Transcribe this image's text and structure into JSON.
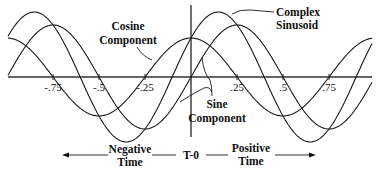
{
  "diagram": {
    "labels": {
      "cosine": [
        "Cosine",
        "Component"
      ],
      "sine": [
        "Sine",
        "Component"
      ],
      "complex": [
        "Complex",
        "Sinusoid"
      ],
      "negative_time": [
        "Negative",
        "Time"
      ],
      "positive_time": [
        "Positive",
        "Time"
      ],
      "origin": "T-0"
    },
    "ticks": [
      {
        "label": "-.75",
        "value": -0.75
      },
      {
        "label": "-.5",
        "value": -0.5
      },
      {
        "label": "-.25",
        "value": -0.25
      },
      {
        "label": ".25",
        "value": 0.25
      },
      {
        "label": ".5",
        "value": 0.5
      },
      {
        "label": ".75",
        "value": 0.75
      }
    ],
    "geometry": {
      "origin_x": 191,
      "axis_y": 77,
      "px_per_unit": 184,
      "x_start": 8,
      "x_end": 372,
      "vaxis_top": 5,
      "vaxis_bottom": 137
    },
    "curves": [
      {
        "name": "cosine-component",
        "amplitude": 39,
        "phase_deg": 90
      },
      {
        "name": "sine-component",
        "amplitude": 52,
        "phase_deg": 0
      },
      {
        "name": "complex-sinusoid",
        "amplitude": 65,
        "phase_deg": 36.87
      }
    ],
    "stroke_color": "#1a1a1a",
    "background": "#ffffff"
  }
}
